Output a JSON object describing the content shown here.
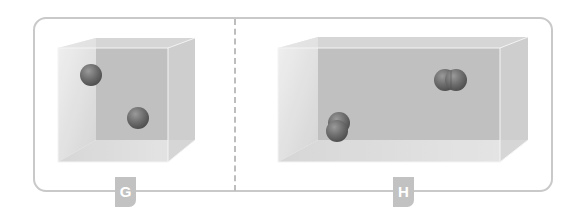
{
  "figure": {
    "panels": [
      {
        "label": "G",
        "container": "cube",
        "particles": [
          {
            "type": "single-atom",
            "count": 1
          },
          {
            "type": "single-atom",
            "count": 1
          }
        ]
      },
      {
        "label": "H",
        "container": "elongated-box",
        "particles": [
          {
            "type": "diatomic-molecule",
            "count": 1
          },
          {
            "type": "diatomic-molecule",
            "count": 1
          }
        ]
      }
    ],
    "colors": {
      "frame": "#c9c9c9",
      "box_back": "#b5b5b5",
      "box_side": "#d6d6d6",
      "atom": "#6f6f6f",
      "tab": "#c2c2c2"
    }
  }
}
